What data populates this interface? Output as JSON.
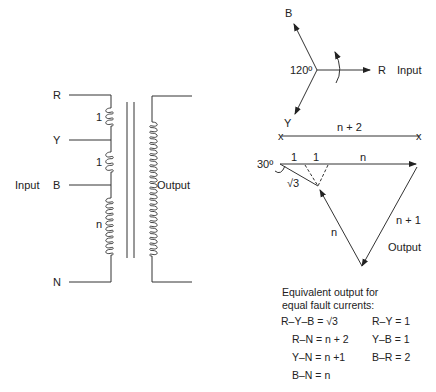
{
  "transformer": {
    "terminals": [
      "R",
      "Y",
      "B",
      "N"
    ],
    "winding_ratios": [
      "1",
      "1",
      "n"
    ],
    "input_label": "Input",
    "output_label": "Output"
  },
  "phasor_input": {
    "phases": [
      "B",
      "R",
      "Y"
    ],
    "angle_label": "120º",
    "input_label": "Input"
  },
  "phasor_output": {
    "top_span_label": "n + 2",
    "segment_labels": [
      "1",
      "1",
      "n"
    ],
    "angle_label": "30º",
    "sqrt_label": "√3",
    "left_side_label": "n",
    "right_side_label": "n + 1",
    "output_label": "Output"
  },
  "equivalents": {
    "heading_line1": "Equivalent output for",
    "heading_line2": "equal fault currents:",
    "left": [
      "R–Y–B = √3",
      "R–N = n + 2",
      "Y–N = n +1",
      "B–N = n"
    ],
    "right": [
      "R–Y = 1",
      "Y–B = 1",
      "B–R = 2"
    ]
  }
}
